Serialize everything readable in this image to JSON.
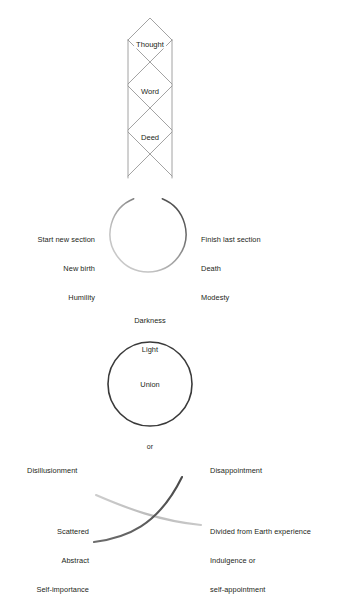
{
  "diagram": {
    "title_present": false,
    "background_color": "#ffffff",
    "text_color": "#231f20",
    "lattice": {
      "name": "thought-word-deed-column",
      "stroke_color": "#8c8c8c",
      "labels": [
        {
          "id": "thought",
          "text": "Thought"
        },
        {
          "id": "word",
          "text": "Word"
        },
        {
          "id": "deed",
          "text": "Deed"
        }
      ]
    },
    "open_circle": {
      "name": "incomplete-circle",
      "gap_at": "top",
      "stroke_light_color": "#bdbdbd",
      "stroke_dark_color": "#3f3f3f",
      "left_label_lines": [
        "Start new section",
        "New birth",
        "Humility"
      ],
      "right_label_lines": [
        "Finish last section",
        "Death",
        "Modesty"
      ]
    },
    "middle_text_lines": [
      "Darkness",
      "Light"
    ],
    "union_circle": {
      "name": "union-circle",
      "stroke_color": "#3a3a3a",
      "label": "Union"
    },
    "connector_text": "or",
    "crossing_curves": {
      "name": "crossing-curves",
      "light_curve_color": "#b9b9b9",
      "dark_curve_color": "#5a5a5a",
      "top_left_label": "Disillusionment",
      "top_right_label": "Disappointment",
      "bottom_left_lines": [
        "Scattered",
        "Abstract",
        "Self-importance"
      ],
      "bottom_right_lines": [
        "Divided from Earth experience",
        "Indulgence or",
        "self-appointment"
      ]
    }
  }
}
